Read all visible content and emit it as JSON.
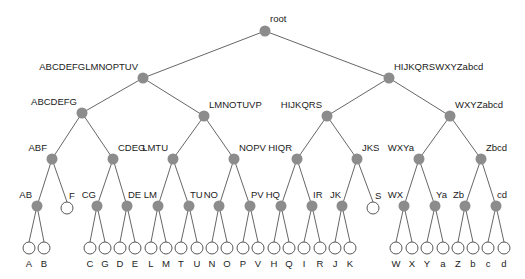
{
  "diagram": {
    "type": "binary-tree",
    "style": {
      "inner_node_color": "#8c8c8c",
      "leaf_fill": "#ffffff",
      "leaf_stroke": "#444444",
      "edge_color": "#555555"
    },
    "nodes": [
      {
        "id": "root",
        "label": "root",
        "x": 265,
        "y": 31,
        "kind": "inner",
        "lx": 270,
        "ly": 22,
        "anchor": "start"
      },
      {
        "id": "n1L",
        "label": "ABCDEFGLMNOPTUV",
        "x": 143,
        "y": 78,
        "kind": "inner",
        "lx": 138,
        "ly": 70,
        "anchor": "end",
        "parent": "root"
      },
      {
        "id": "n1R",
        "label": "HIJKQRSWXYZabcd",
        "x": 389,
        "y": 78,
        "kind": "inner",
        "lx": 394,
        "ly": 70,
        "anchor": "start",
        "parent": "root"
      },
      {
        "id": "n2a",
        "label": "ABCDEFG",
        "x": 82,
        "y": 113,
        "kind": "inner",
        "lx": 77,
        "ly": 105,
        "anchor": "end",
        "parent": "n1L"
      },
      {
        "id": "n2b",
        "label": "LMNOTUVP",
        "x": 204,
        "y": 116,
        "kind": "inner",
        "lx": 209,
        "ly": 108,
        "anchor": "start",
        "parent": "n1L"
      },
      {
        "id": "n2c",
        "label": "HIJKQRS",
        "x": 327,
        "y": 116,
        "kind": "inner",
        "lx": 322,
        "ly": 108,
        "anchor": "end",
        "parent": "n1R"
      },
      {
        "id": "n2d",
        "label": "WXYZabcd",
        "x": 450,
        "y": 116,
        "kind": "inner",
        "lx": 455,
        "ly": 108,
        "anchor": "start",
        "parent": "n1R"
      },
      {
        "id": "n3a",
        "label": "ABF",
        "x": 52,
        "y": 159,
        "kind": "inner",
        "lx": 47,
        "ly": 151,
        "anchor": "end",
        "parent": "n2a"
      },
      {
        "id": "n3b",
        "label": "CDEG",
        "x": 113,
        "y": 159,
        "kind": "inner",
        "lx": 118,
        "ly": 151,
        "anchor": "start",
        "parent": "n2a"
      },
      {
        "id": "n3c",
        "label": "LMTU",
        "x": 173,
        "y": 159,
        "kind": "inner",
        "lx": 168,
        "ly": 151,
        "anchor": "end",
        "parent": "n2b"
      },
      {
        "id": "n3d",
        "label": "NOPV",
        "x": 234,
        "y": 159,
        "kind": "inner",
        "lx": 239,
        "ly": 151,
        "anchor": "start",
        "parent": "n2b"
      },
      {
        "id": "n3e",
        "label": "HIQR",
        "x": 297,
        "y": 159,
        "kind": "inner",
        "lx": 292,
        "ly": 151,
        "anchor": "end",
        "parent": "n2c"
      },
      {
        "id": "n3f",
        "label": "JKS",
        "x": 357,
        "y": 159,
        "kind": "inner",
        "lx": 362,
        "ly": 151,
        "anchor": "start",
        "parent": "n2c"
      },
      {
        "id": "n3g",
        "label": "WXYa",
        "x": 419,
        "y": 159,
        "kind": "inner",
        "lx": 414,
        "ly": 151,
        "anchor": "end",
        "parent": "n2d"
      },
      {
        "id": "n3h",
        "label": "Zbcd",
        "x": 481,
        "y": 159,
        "kind": "inner",
        "lx": 486,
        "ly": 151,
        "anchor": "start",
        "parent": "n2d"
      },
      {
        "id": "n4a",
        "label": "AB",
        "x": 37,
        "y": 206,
        "kind": "inner",
        "lx": 32,
        "ly": 198,
        "anchor": "end",
        "parent": "n3a"
      },
      {
        "id": "n4b",
        "label": "F",
        "x": 67,
        "y": 208,
        "kind": "leaf",
        "lx": 69,
        "ly": 199,
        "anchor": "start",
        "parent": "n3a"
      },
      {
        "id": "n4c",
        "label": "CG",
        "x": 97,
        "y": 206,
        "kind": "inner",
        "lx": 96,
        "ly": 198,
        "anchor": "end",
        "parent": "n3b"
      },
      {
        "id": "n4d",
        "label": "DE",
        "x": 127,
        "y": 206,
        "kind": "inner",
        "lx": 128,
        "ly": 198,
        "anchor": "start",
        "parent": "n3b"
      },
      {
        "id": "n4e",
        "label": "LM",
        "x": 158,
        "y": 206,
        "kind": "inner",
        "lx": 157,
        "ly": 198,
        "anchor": "end",
        "parent": "n3c"
      },
      {
        "id": "n4f",
        "label": "TU",
        "x": 189,
        "y": 206,
        "kind": "inner",
        "lx": 190,
        "ly": 198,
        "anchor": "start",
        "parent": "n3c"
      },
      {
        "id": "n4g",
        "label": "NO",
        "x": 219,
        "y": 206,
        "kind": "inner",
        "lx": 218,
        "ly": 198,
        "anchor": "end",
        "parent": "n3d"
      },
      {
        "id": "n4h",
        "label": "PV",
        "x": 250,
        "y": 206,
        "kind": "inner",
        "lx": 251,
        "ly": 198,
        "anchor": "start",
        "parent": "n3d"
      },
      {
        "id": "n4i",
        "label": "HQ",
        "x": 281,
        "y": 206,
        "kind": "inner",
        "lx": 280,
        "ly": 198,
        "anchor": "end",
        "parent": "n3e"
      },
      {
        "id": "n4j",
        "label": "IR",
        "x": 312,
        "y": 206,
        "kind": "inner",
        "lx": 313,
        "ly": 198,
        "anchor": "start",
        "parent": "n3e"
      },
      {
        "id": "n4k",
        "label": "JK",
        "x": 342,
        "y": 206,
        "kind": "inner",
        "lx": 341,
        "ly": 198,
        "anchor": "end",
        "parent": "n3f"
      },
      {
        "id": "n4l",
        "label": "S",
        "x": 373,
        "y": 208,
        "kind": "leaf",
        "lx": 375,
        "ly": 199,
        "anchor": "start",
        "parent": "n3f"
      },
      {
        "id": "n4m",
        "label": "WX",
        "x": 404,
        "y": 206,
        "kind": "inner",
        "lx": 403,
        "ly": 198,
        "anchor": "end",
        "parent": "n3g"
      },
      {
        "id": "n4n",
        "label": "Ya",
        "x": 435,
        "y": 206,
        "kind": "inner",
        "lx": 436,
        "ly": 198,
        "anchor": "start",
        "parent": "n3g"
      },
      {
        "id": "n4o",
        "label": "Zb",
        "x": 465,
        "y": 206,
        "kind": "inner",
        "lx": 464,
        "ly": 198,
        "anchor": "end",
        "parent": "n3h"
      },
      {
        "id": "n4p",
        "label": "cd",
        "x": 496,
        "y": 206,
        "kind": "inner",
        "lx": 497,
        "ly": 198,
        "anchor": "start",
        "parent": "n3h"
      },
      {
        "id": "lA",
        "label": "A",
        "x": 29,
        "y": 248,
        "kind": "leaf",
        "parent": "n4a"
      },
      {
        "id": "lB",
        "label": "B",
        "x": 44,
        "y": 248,
        "kind": "leaf",
        "parent": "n4a"
      },
      {
        "id": "lC",
        "label": "C",
        "x": 90,
        "y": 248,
        "kind": "leaf",
        "parent": "n4c"
      },
      {
        "id": "lG",
        "label": "G",
        "x": 105,
        "y": 248,
        "kind": "leaf",
        "parent": "n4c"
      },
      {
        "id": "lD",
        "label": "D",
        "x": 120,
        "y": 248,
        "kind": "leaf",
        "parent": "n4d"
      },
      {
        "id": "lE",
        "label": "E",
        "x": 135,
        "y": 248,
        "kind": "leaf",
        "parent": "n4d"
      },
      {
        "id": "lL",
        "label": "L",
        "x": 151,
        "y": 248,
        "kind": "leaf",
        "parent": "n4e"
      },
      {
        "id": "lM",
        "label": "M",
        "x": 166,
        "y": 248,
        "kind": "leaf",
        "parent": "n4e"
      },
      {
        "id": "lT",
        "label": "T",
        "x": 181,
        "y": 248,
        "kind": "leaf",
        "parent": "n4f"
      },
      {
        "id": "lU",
        "label": "U",
        "x": 197,
        "y": 248,
        "kind": "leaf",
        "parent": "n4f"
      },
      {
        "id": "lN",
        "label": "N",
        "x": 212,
        "y": 248,
        "kind": "leaf",
        "parent": "n4g"
      },
      {
        "id": "lO",
        "label": "O",
        "x": 227,
        "y": 248,
        "kind": "leaf",
        "parent": "n4g"
      },
      {
        "id": "lP",
        "label": "P",
        "x": 243,
        "y": 248,
        "kind": "leaf",
        "parent": "n4h"
      },
      {
        "id": "lV",
        "label": "V",
        "x": 258,
        "y": 248,
        "kind": "leaf",
        "parent": "n4h"
      },
      {
        "id": "lH",
        "label": "H",
        "x": 274,
        "y": 248,
        "kind": "leaf",
        "parent": "n4i"
      },
      {
        "id": "lQ",
        "label": "Q",
        "x": 289,
        "y": 248,
        "kind": "leaf",
        "parent": "n4i"
      },
      {
        "id": "lI",
        "label": "I",
        "x": 304,
        "y": 248,
        "kind": "leaf",
        "parent": "n4j"
      },
      {
        "id": "lR",
        "label": "R",
        "x": 320,
        "y": 248,
        "kind": "leaf",
        "parent": "n4j"
      },
      {
        "id": "lJ",
        "label": "J",
        "x": 335,
        "y": 248,
        "kind": "leaf",
        "parent": "n4k"
      },
      {
        "id": "lK",
        "label": "K",
        "x": 350,
        "y": 248,
        "kind": "leaf",
        "parent": "n4k"
      },
      {
        "id": "lW",
        "label": "W",
        "x": 396,
        "y": 248,
        "kind": "leaf",
        "parent": "n4m"
      },
      {
        "id": "lX",
        "label": "X",
        "x": 412,
        "y": 248,
        "kind": "leaf",
        "parent": "n4m"
      },
      {
        "id": "lY",
        "label": "Y",
        "x": 427,
        "y": 248,
        "kind": "leaf",
        "parent": "n4n"
      },
      {
        "id": "la",
        "label": "a",
        "x": 443,
        "y": 248,
        "kind": "leaf",
        "parent": "n4n"
      },
      {
        "id": "lZ",
        "label": "Z",
        "x": 458,
        "y": 248,
        "kind": "leaf",
        "parent": "n4o"
      },
      {
        "id": "lb",
        "label": "b",
        "x": 473,
        "y": 248,
        "kind": "leaf",
        "parent": "n4o"
      },
      {
        "id": "lc",
        "label": "c",
        "x": 488,
        "y": 248,
        "kind": "leaf",
        "parent": "n4p"
      },
      {
        "id": "ld",
        "label": "d",
        "x": 504,
        "y": 248,
        "kind": "leaf",
        "parent": "n4p"
      }
    ]
  }
}
